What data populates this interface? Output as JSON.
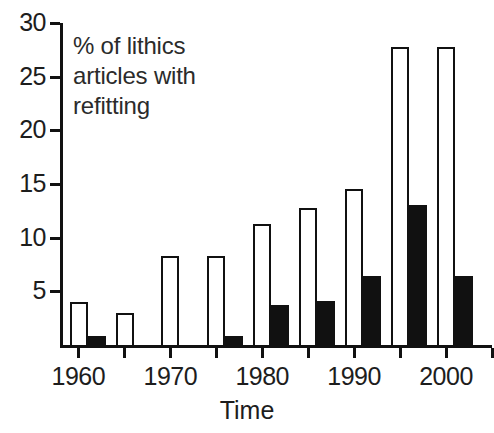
{
  "chart_data": {
    "type": "bar",
    "title": "",
    "annotation": "% of lithics\narticles with\nrefitting",
    "xlabel": "Time",
    "ylabel": "",
    "grid": false,
    "legend_position": "none",
    "xlim": [
      1958,
      2005
    ],
    "ylim": [
      0,
      30
    ],
    "ytick_labels": [
      "30",
      "25",
      "20",
      "15",
      "10",
      "5"
    ],
    "ytick_values": [
      30,
      25,
      20,
      15,
      10,
      5
    ],
    "xtick_labels": [
      "1960",
      "1970",
      "1980",
      "1990",
      "2000"
    ],
    "xtick_values": [
      1960,
      1970,
      1980,
      1990,
      2000
    ],
    "xminor_tick_values": [
      1965,
      1975,
      1985,
      1995,
      2005
    ],
    "categories": [
      1961,
      1966,
      1971,
      1976,
      1981,
      1986,
      1991,
      1996,
      2001
    ],
    "series": [
      {
        "name": "open",
        "style": "white-filled-black-outline",
        "values": [
          4.0,
          3.0,
          8.3,
          8.3,
          11.3,
          12.8,
          14.5,
          27.8,
          27.8
        ]
      },
      {
        "name": "filled",
        "style": "solid-black",
        "values": [
          0.8,
          0.0,
          0.0,
          0.8,
          3.7,
          4.1,
          6.4,
          13.0,
          6.4
        ]
      }
    ]
  }
}
